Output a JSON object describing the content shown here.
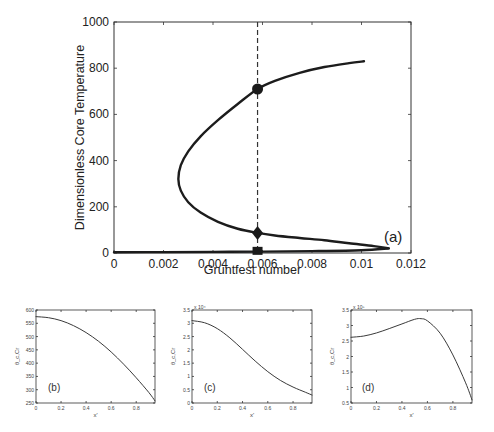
{
  "chart_data": [
    {
      "id": "a",
      "type": "line",
      "panel_label": "(a)",
      "title": "",
      "xlabel": "Gruntfest number",
      "ylabel": "Dimensionless Core Temperature",
      "xlim": [
        0,
        0.012
      ],
      "ylim": [
        0,
        1000
      ],
      "x_ticks": [
        "0",
        "0.002",
        "0.004",
        "0.006",
        "0.008",
        "0.01",
        "0.012"
      ],
      "y_ticks": [
        "0",
        "200",
        "400",
        "600",
        "800",
        "1000"
      ],
      "grid": false,
      "series": [
        {
          "name": "bifurcation curve",
          "x": [
            0.0111,
            0.0105,
            0.0095,
            0.0085,
            0.0075,
            0.0065,
            0.0058,
            0.005,
            0.0042,
            0.0035,
            0.003,
            0.0027,
            0.0026,
            0.0027,
            0.003,
            0.0035,
            0.0042,
            0.005,
            0.0058,
            0.0065,
            0.0075,
            0.0085,
            0.0095,
            0.0101
          ],
          "y": [
            20,
            30,
            42,
            55,
            65,
            76,
            87,
            105,
            135,
            175,
            220,
            270,
            320,
            380,
            440,
            505,
            575,
            645,
            710,
            745,
            780,
            805,
            822,
            830
          ]
        },
        {
          "name": "lower baseline branch",
          "x": [
            0,
            0.002,
            0.004,
            0.006,
            0.008,
            0.01,
            0.0111
          ],
          "y": [
            3,
            4,
            5,
            6,
            8,
            12,
            20
          ]
        }
      ],
      "markers": [
        {
          "shape": "circle",
          "x": 0.0058,
          "y": 710
        },
        {
          "shape": "diamond",
          "x": 0.0058,
          "y": 87
        },
        {
          "shape": "square",
          "x": 0.0058,
          "y": 5
        }
      ],
      "vline": {
        "x": 0.0058,
        "style": "dashed"
      }
    },
    {
      "id": "b",
      "type": "line",
      "panel_label": "(b)",
      "xlabel": "x'",
      "ylabel": "θ_c,Cr",
      "xlim": [
        0,
        0.95
      ],
      "ylim": [
        250,
        600
      ],
      "x_ticks": [
        "0",
        "0.2",
        "0.4",
        "0.6",
        "0.8"
      ],
      "y_ticks": [
        "250",
        "300",
        "350",
        "400",
        "450",
        "500",
        "550",
        "600"
      ],
      "series": [
        {
          "name": "profile",
          "x": [
            0,
            0.1,
            0.2,
            0.3,
            0.4,
            0.5,
            0.6,
            0.7,
            0.8,
            0.9,
            0.95
          ],
          "y": [
            575,
            571,
            560,
            541,
            515,
            482,
            442,
            396,
            345,
            290,
            258
          ]
        }
      ]
    },
    {
      "id": "c",
      "type": "line",
      "panel_label": "(c)",
      "xlabel": "x'",
      "ylabel": "θ_c,Cr",
      "y_multiplier": "x 10⁴",
      "xlim": [
        0,
        0.95
      ],
      "ylim": [
        0,
        3.5
      ],
      "x_ticks": [
        "0",
        "0.2",
        "0.4",
        "0.6",
        "0.8"
      ],
      "y_ticks": [
        "0",
        "0.5",
        "1",
        "1.5",
        "2",
        "2.5",
        "3",
        "3.5"
      ],
      "series": [
        {
          "name": "profile",
          "x": [
            0,
            0.1,
            0.2,
            0.3,
            0.4,
            0.5,
            0.6,
            0.7,
            0.8,
            0.9,
            0.95
          ],
          "y": [
            3.1,
            3.02,
            2.8,
            2.45,
            2.02,
            1.58,
            1.18,
            0.85,
            0.6,
            0.4,
            0.3
          ]
        }
      ]
    },
    {
      "id": "d",
      "type": "line",
      "panel_label": "(d)",
      "xlabel": "x'",
      "ylabel": "θ_c,Cr",
      "y_multiplier": "x 10⁵",
      "xlim": [
        0,
        0.95
      ],
      "ylim": [
        0.5,
        3.5
      ],
      "x_ticks": [
        "0",
        "0.2",
        "0.4",
        "0.6",
        "0.8"
      ],
      "y_ticks": [
        "0.5",
        "1",
        "1.5",
        "2",
        "2.5",
        "3",
        "3.5"
      ],
      "series": [
        {
          "name": "profile",
          "x": [
            0,
            0.1,
            0.2,
            0.3,
            0.4,
            0.5,
            0.55,
            0.6,
            0.7,
            0.8,
            0.9,
            0.95
          ],
          "y": [
            2.62,
            2.66,
            2.76,
            2.9,
            3.05,
            3.2,
            3.22,
            3.15,
            2.75,
            2.05,
            1.15,
            0.6
          ]
        }
      ]
    }
  ]
}
